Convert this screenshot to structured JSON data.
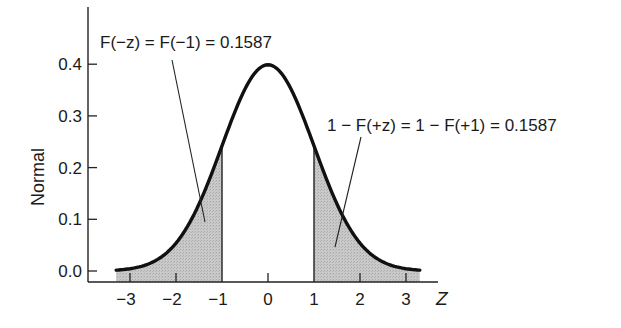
{
  "chart_data": {
    "type": "line",
    "title": "",
    "xlabel": "Z",
    "ylabel": "Normal",
    "xlim": [
      -3.3,
      3.3
    ],
    "ylim": [
      0.0,
      0.4
    ],
    "x_ticks": [
      -3,
      -2,
      -1,
      0,
      1,
      2,
      3
    ],
    "x_tick_labels": [
      "−3",
      "−2",
      "−1",
      "0",
      "1",
      "2",
      "3"
    ],
    "y_ticks": [
      0.0,
      0.1,
      0.2,
      0.3,
      0.4
    ],
    "y_tick_labels": [
      "0.0",
      "0.1",
      "0.2",
      "0.3",
      "0.4"
    ],
    "grid": false,
    "legend": null,
    "series": [
      {
        "name": "Standard normal density",
        "x": [
          -3.3,
          -3,
          -2.5,
          -2,
          -1.5,
          -1,
          -0.5,
          0,
          0.5,
          1,
          1.5,
          2,
          2.5,
          3,
          3.3
        ],
        "values": [
          0.0017,
          0.0044,
          0.0175,
          0.054,
          0.1295,
          0.242,
          0.3521,
          0.3989,
          0.3521,
          0.242,
          0.1295,
          0.054,
          0.0175,
          0.0044,
          0.0017
        ]
      }
    ],
    "shaded_regions": [
      {
        "from": -3.3,
        "to": -1,
        "label": "left tail"
      },
      {
        "from": 1,
        "to": 3.3,
        "label": "right tail"
      }
    ],
    "annotations": [
      {
        "text": "F(−z) = F(−1) = 0.1587",
        "points_to": [
          -1.4,
          0.09
        ]
      },
      {
        "text": "1 − F(+z) = 1 − F(+1) = 0.1587",
        "points_to": [
          1.5,
          0.05
        ]
      }
    ]
  },
  "labels": {
    "ylabel": "Normal",
    "xlabel": "Z",
    "left_annotation": "F(−z) = F(−1) = 0.1587",
    "right_annotation": "1 − F(+z) = 1 − F(+1) = 0.1587"
  },
  "style": {
    "curve_color": "#111111",
    "shade_color": "#c4c4c4",
    "axis_color": "#222222"
  }
}
